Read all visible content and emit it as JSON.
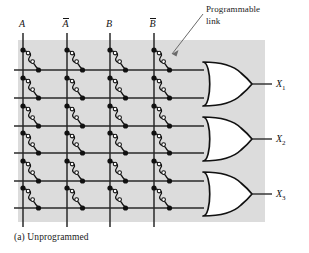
{
  "figure": {
    "caption": "(a)  Unprogrammed",
    "annotation": {
      "label": "Programmable link",
      "line1": "Programmable",
      "line2": "link"
    },
    "background_color": "#dcdcdc",
    "line_color": "#1a1a1a",
    "page_color": "#ffffff"
  },
  "inputs": [
    {
      "id": "A",
      "label": "A",
      "overbar": false,
      "x": 23
    },
    {
      "id": "An",
      "label": "A",
      "overbar": true,
      "x": 67
    },
    {
      "id": "B",
      "label": "B",
      "overbar": false,
      "x": 110
    },
    {
      "id": "Bn",
      "label": "B",
      "overbar": true,
      "x": 154
    }
  ],
  "product_rows": [
    {
      "index": 1,
      "y": 70,
      "gate": 1
    },
    {
      "index": 2,
      "y": 98,
      "gate": 1
    },
    {
      "index": 3,
      "y": 126,
      "gate": 2
    },
    {
      "index": 4,
      "y": 153,
      "gate": 2
    },
    {
      "index": 5,
      "y": 181,
      "gate": 3
    },
    {
      "index": 6,
      "y": 208,
      "gate": 3
    }
  ],
  "gates": [
    {
      "id": "or1",
      "type": "OR",
      "output_label": "X",
      "output_sub": "1",
      "cy": 84,
      "label_x": 283,
      "label_y": 79
    },
    {
      "id": "or2",
      "type": "OR",
      "output_label": "X",
      "output_sub": "2",
      "cy": 139,
      "label_x": 283,
      "label_y": 134
    },
    {
      "id": "or3",
      "type": "OR",
      "output_label": "X",
      "output_sub": "3",
      "cy": 194,
      "label_x": 283,
      "label_y": 189
    }
  ],
  "link_state": "unprogrammed",
  "links_total": 24,
  "geometry": {
    "plane_x": 18,
    "plane_y": 40,
    "plane_w": 247,
    "plane_h": 182,
    "col_spacing": 43.5,
    "row_spacing": 27.6,
    "gate_left": 203,
    "gate_right": 253,
    "gate_half_height": 22
  }
}
